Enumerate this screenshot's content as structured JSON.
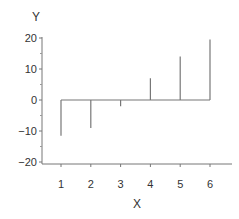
{
  "chart_data": {
    "type": "stem",
    "title": "",
    "xlabel": "X",
    "ylabel": "Y",
    "x": [
      1,
      2,
      3,
      4,
      5,
      6
    ],
    "values": [
      -11.5,
      -9,
      -2,
      7,
      14,
      19.5
    ],
    "baseline": 0,
    "xlim": [
      0.4,
      6.7
    ],
    "ylim": [
      -20.5,
      20.5
    ],
    "xticks": [
      "1",
      "2",
      "3",
      "4",
      "5",
      "6"
    ],
    "yticks": [
      "20",
      "10",
      "0",
      "-10",
      "-20"
    ],
    "grid": false,
    "legend": null,
    "colors": {
      "line": "#777777",
      "axis": "#666666",
      "text": "#333333"
    }
  }
}
